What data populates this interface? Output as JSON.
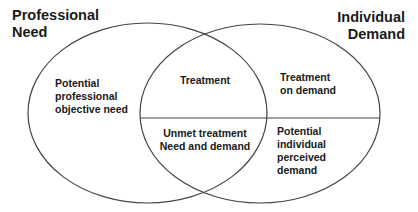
{
  "diagram": {
    "type": "venn",
    "sets": [
      {
        "name": "professional-need",
        "label_lines": [
          "Professional",
          "Need"
        ]
      },
      {
        "name": "individual-demand",
        "label_lines": [
          "Individual",
          "Demand"
        ]
      }
    ],
    "regions": {
      "professional_only": {
        "lines": [
          "Potential",
          "professional",
          "objective need"
        ]
      },
      "overlap_top": {
        "lines": [
          "Treatment"
        ]
      },
      "overlap_bottom": {
        "lines": [
          "Unmet treatment",
          "Need and demand"
        ]
      },
      "individual_top": {
        "lines": [
          "Treatment",
          "on demand"
        ]
      },
      "individual_bottom": {
        "lines": [
          "Potential",
          "individual",
          "perceived",
          "demand"
        ]
      }
    },
    "colors": {
      "stroke": "#444444",
      "text": "#1a1a1a",
      "background": "#ffffff"
    }
  }
}
